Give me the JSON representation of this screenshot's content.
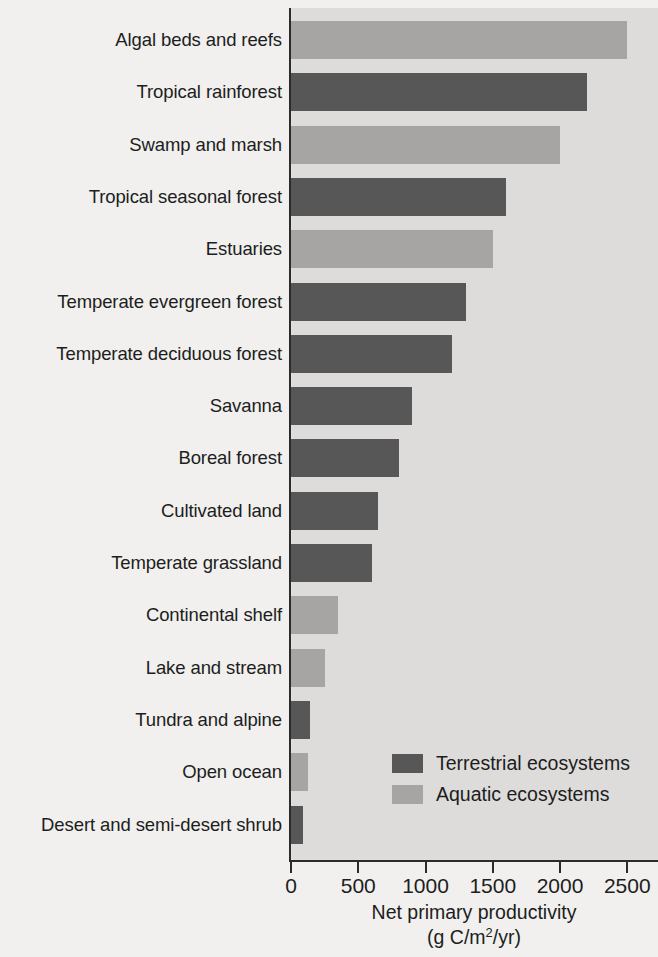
{
  "chart_data": {
    "type": "bar",
    "orientation": "horizontal",
    "title": "",
    "xlabel": "Net primary productivity (g C/m2/yr)",
    "xlabel_line1": "Net primary productivity",
    "xlabel_line2_prefix": "(g C/m",
    "xlabel_line2_sup": "2",
    "xlabel_line2_suffix": "/yr)",
    "ylabel": "",
    "xlim": [
      0,
      2650
    ],
    "xticks": [
      0,
      500,
      1000,
      1500,
      2000,
      2500
    ],
    "xticklabels": [
      "0",
      "500",
      "1000",
      "1500",
      "2000",
      "2500"
    ],
    "grid": false,
    "legend_position": "lower right",
    "categories": [
      "Algal beds and reefs",
      "Tropical rainforest",
      "Swamp and marsh",
      "Tropical seasonal forest",
      "Estuaries",
      "Temperate evergreen forest",
      "Temperate deciduous forest",
      "Savanna",
      "Boreal forest",
      "Cultivated land",
      "Temperate grassland",
      "Continental shelf",
      "Lake and stream",
      "Tundra and alpine",
      "Open ocean",
      "Desert and semi-desert shrub"
    ],
    "values": [
      2500,
      2200,
      2000,
      1600,
      1500,
      1300,
      1200,
      900,
      800,
      650,
      600,
      350,
      250,
      140,
      125,
      90
    ],
    "groups": [
      "aquatic",
      "terrestrial",
      "aquatic",
      "terrestrial",
      "aquatic",
      "terrestrial",
      "terrestrial",
      "terrestrial",
      "terrestrial",
      "terrestrial",
      "terrestrial",
      "aquatic",
      "aquatic",
      "terrestrial",
      "aquatic",
      "terrestrial"
    ],
    "bars": [
      {
        "label": "Algal beds and reefs",
        "value": 2500,
        "group": "aquatic"
      },
      {
        "label": "Tropical rainforest",
        "value": 2200,
        "group": "terrestrial"
      },
      {
        "label": "Swamp and marsh",
        "value": 2000,
        "group": "aquatic"
      },
      {
        "label": "Tropical seasonal forest",
        "value": 1600,
        "group": "terrestrial"
      },
      {
        "label": "Estuaries",
        "value": 1500,
        "group": "aquatic"
      },
      {
        "label": "Temperate evergreen forest",
        "value": 1300,
        "group": "terrestrial"
      },
      {
        "label": "Temperate deciduous forest",
        "value": 1200,
        "group": "terrestrial"
      },
      {
        "label": "Savanna",
        "value": 900,
        "group": "terrestrial"
      },
      {
        "label": "Boreal forest",
        "value": 800,
        "group": "terrestrial"
      },
      {
        "label": "Cultivated land",
        "value": 650,
        "group": "terrestrial"
      },
      {
        "label": "Temperate grassland",
        "value": 600,
        "group": "terrestrial"
      },
      {
        "label": "Continental shelf",
        "value": 350,
        "group": "aquatic"
      },
      {
        "label": "Lake and stream",
        "value": 250,
        "group": "aquatic"
      },
      {
        "label": "Tundra and alpine",
        "value": 140,
        "group": "terrestrial"
      },
      {
        "label": "Open ocean",
        "value": 125,
        "group": "aquatic"
      },
      {
        "label": "Desert and semi-desert shrub",
        "value": 90,
        "group": "terrestrial"
      }
    ],
    "legend": [
      {
        "key": "terrestrial",
        "label": "Terrestrial ecosystems",
        "color": "#575757"
      },
      {
        "key": "aquatic",
        "label": "Aquatic ecosystems",
        "color": "#a6a5a3"
      }
    ]
  },
  "colors": {
    "terrestrial": "#575757",
    "aquatic": "#a6a5a3",
    "plot_background": "#dddcda",
    "page_background": "#f1f0ee",
    "axis": "#2b2b2b",
    "text": "#201d1d"
  }
}
